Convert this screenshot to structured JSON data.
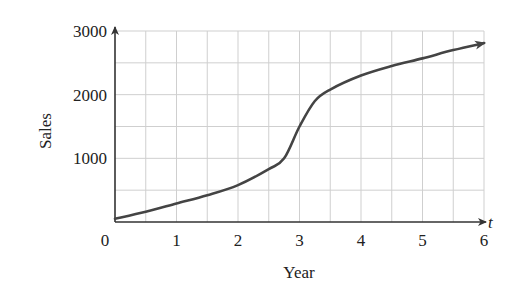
{
  "chart_data": {
    "type": "line",
    "title": "",
    "xlabel": "Year",
    "ylabel": "Sales",
    "x_variable": "t",
    "xlim": [
      0,
      6
    ],
    "ylim": [
      0,
      3000
    ],
    "grid": true,
    "x_ticks": [
      0,
      1,
      2,
      3,
      4,
      5,
      6
    ],
    "x_tick_labels": [
      "0",
      "1",
      "2",
      "3",
      "4",
      "5",
      "6"
    ],
    "y_ticks": [
      1000,
      2000,
      3000
    ],
    "y_tick_labels": [
      "1000",
      "2000",
      "3000"
    ],
    "x_grid_step": 0.5,
    "y_grid_step": 500,
    "legend": null,
    "series": [
      {
        "name": "Sales",
        "color": "#444444",
        "x": [
          0,
          0.5,
          1,
          1.5,
          2,
          2.5,
          2.75,
          3,
          3.25,
          3.5,
          4,
          4.5,
          5,
          5.5,
          6
        ],
        "y": [
          50,
          160,
          290,
          420,
          580,
          830,
          1000,
          1500,
          1900,
          2080,
          2300,
          2450,
          2570,
          2700,
          2810
        ]
      }
    ],
    "annotations": [
      "arrowhead at end of curve",
      "arrowheads on both axes"
    ]
  },
  "colors": {
    "curve": "#444444",
    "grid": "#cfcfcf",
    "axis": "#333333",
    "text": "#222222"
  }
}
